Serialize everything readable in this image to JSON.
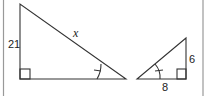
{
  "figure": {
    "large_triangle": {
      "vertical_leg_label": "21",
      "hypotenuse_label": "x",
      "right_angle_marked": true,
      "angle_mark": "single arc with tick"
    },
    "small_triangle": {
      "vertical_leg_label": "6",
      "horizontal_leg_label": "8",
      "right_angle_marked": true,
      "angle_mark": "single arc with tick"
    }
  }
}
